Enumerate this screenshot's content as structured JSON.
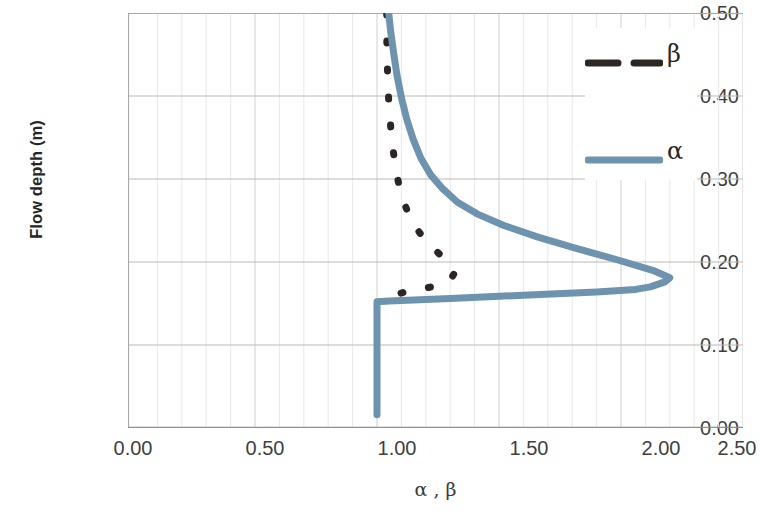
{
  "chart_data": {
    "type": "line",
    "title": "",
    "xlabel": "α , β",
    "ylabel": "Flow depth (m)",
    "xlim": [
      0.0,
      2.5
    ],
    "ylim": [
      0.0,
      0.5
    ],
    "xticks": [
      "0.00",
      "0.50",
      "1.00",
      "1.50",
      "2.00",
      "2.50"
    ],
    "xtick_values": [
      0.0,
      0.5,
      1.0,
      1.5,
      2.0,
      2.5
    ],
    "yticks": [
      "0.00",
      "0.10",
      "0.20",
      "0.30",
      "0.40",
      "0.50"
    ],
    "ytick_values": [
      0.0,
      0.1,
      0.2,
      0.3,
      0.4,
      0.5
    ],
    "grid": "major horizontal and minor vertical gridlines",
    "legend_position": "top-right inside plot",
    "orientation": "x = coefficient value, y = flow depth (m)",
    "series": [
      {
        "name": "β",
        "label": "β",
        "color": "#2b2523",
        "style": "dashed",
        "width": 7,
        "points": [
          [
            1.04,
            0.5
          ],
          [
            1.04,
            0.47
          ],
          [
            1.042,
            0.44
          ],
          [
            1.045,
            0.41
          ],
          [
            1.05,
            0.385
          ],
          [
            1.057,
            0.36
          ],
          [
            1.066,
            0.335
          ],
          [
            1.078,
            0.31
          ],
          [
            1.092,
            0.29
          ],
          [
            1.11,
            0.272
          ],
          [
            1.132,
            0.256
          ],
          [
            1.158,
            0.242
          ],
          [
            1.188,
            0.23
          ],
          [
            1.222,
            0.219
          ],
          [
            1.258,
            0.209
          ],
          [
            1.288,
            0.2
          ],
          [
            1.31,
            0.192
          ],
          [
            1.316,
            0.186
          ],
          [
            1.3,
            0.178
          ],
          [
            1.255,
            0.172
          ],
          [
            1.19,
            0.168
          ],
          [
            1.12,
            0.164
          ],
          [
            1.06,
            0.16
          ],
          [
            1.02,
            0.156
          ]
        ]
      },
      {
        "name": "α",
        "label": "α",
        "color": "#6e93ae",
        "style": "solid",
        "width": 7,
        "points": [
          [
            1.0,
            0.016
          ],
          [
            1.0,
            0.06
          ],
          [
            1.0,
            0.1
          ],
          [
            1.0,
            0.14
          ],
          [
            1.0,
            0.152
          ],
          [
            1.05,
            0.153
          ],
          [
            1.3,
            0.156
          ],
          [
            1.6,
            0.16
          ],
          [
            1.9,
            0.164
          ],
          [
            2.06,
            0.167
          ],
          [
            2.12,
            0.17
          ],
          [
            2.18,
            0.176
          ],
          [
            2.2,
            0.181
          ],
          [
            2.13,
            0.19
          ],
          [
            1.98,
            0.203
          ],
          [
            1.82,
            0.216
          ],
          [
            1.66,
            0.23
          ],
          [
            1.52,
            0.244
          ],
          [
            1.41,
            0.258
          ],
          [
            1.33,
            0.272
          ],
          [
            1.27,
            0.288
          ],
          [
            1.22,
            0.305
          ],
          [
            1.18,
            0.325
          ],
          [
            1.148,
            0.348
          ],
          [
            1.122,
            0.372
          ],
          [
            1.1,
            0.398
          ],
          [
            1.082,
            0.425
          ],
          [
            1.068,
            0.452
          ],
          [
            1.056,
            0.478
          ],
          [
            1.048,
            0.5
          ]
        ]
      }
    ]
  },
  "legend": {
    "items": [
      {
        "label": "β",
        "color": "#2b2523",
        "style": "dashed"
      },
      {
        "label": "α",
        "color": "#6e93ae",
        "style": "solid"
      }
    ]
  },
  "axes": {
    "y_title": "Flow depth (m)",
    "x_title": "α , β"
  }
}
